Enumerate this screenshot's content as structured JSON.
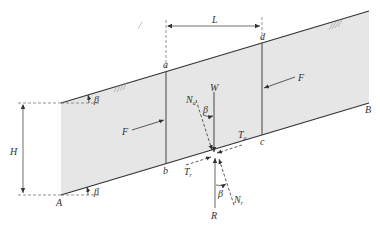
{
  "diagram": {
    "colors": {
      "soil_fill": "#e6e6e6",
      "line": "#333333",
      "dashed": "#555555",
      "background": "#ffffff"
    },
    "labels": {
      "L": "L",
      "H": "H",
      "A": "A",
      "B": "B",
      "a": "a",
      "b": "b",
      "c": "c",
      "d": "d",
      "W": "W",
      "F_left": "F",
      "F_right": "F",
      "R": "R",
      "beta_top": "β",
      "beta_bottom": "β",
      "beta_W": "β",
      "beta_R": "β",
      "N_a_main": "N",
      "N_a_sub": "a",
      "N_r_main": "N",
      "N_r_sub": "r",
      "T_a_main": "T",
      "T_a_sub": "a",
      "T_r_main": "T",
      "T_r_sub": "r"
    },
    "hatch_symbol": "////"
  }
}
